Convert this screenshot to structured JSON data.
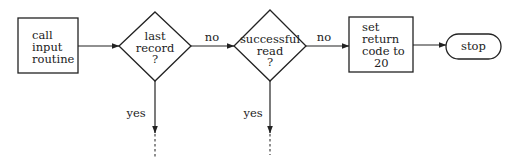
{
  "diagram": {
    "type": "flowchart",
    "nodes": [
      {
        "id": "call_input",
        "shape": "rectangle",
        "lines": [
          "call",
          "input",
          "routine"
        ]
      },
      {
        "id": "last_record",
        "shape": "diamond",
        "lines": [
          "last",
          "record",
          "?"
        ]
      },
      {
        "id": "successful_read",
        "shape": "diamond",
        "lines": [
          "successful",
          "read",
          "?"
        ]
      },
      {
        "id": "set_return",
        "shape": "rectangle",
        "lines": [
          "set",
          "return",
          "code to",
          "20"
        ]
      },
      {
        "id": "stop",
        "shape": "terminal",
        "lines": [
          "stop"
        ]
      }
    ],
    "edges": [
      {
        "from": "call_input",
        "to": "last_record",
        "label": ""
      },
      {
        "from": "last_record",
        "to": "successful_read",
        "label": "no"
      },
      {
        "from": "last_record",
        "to": "continues-below",
        "label": "yes"
      },
      {
        "from": "successful_read",
        "to": "set_return",
        "label": "no"
      },
      {
        "from": "successful_read",
        "to": "continues-below",
        "label": "yes"
      },
      {
        "from": "set_return",
        "to": "stop",
        "label": ""
      }
    ],
    "labels": {
      "edge_no_1": "no",
      "edge_no_2": "no",
      "edge_yes_1": "yes",
      "edge_yes_2": "yes"
    }
  }
}
